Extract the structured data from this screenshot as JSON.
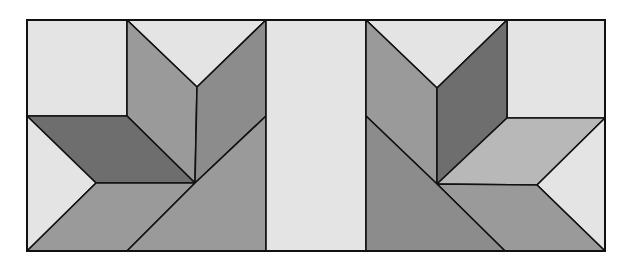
{
  "figure": {
    "colors": {
      "light": "#e4e4e4",
      "medium_light": "#b8b8b8",
      "medium": "#9a9a9a",
      "medium_dark": "#8c8c8c",
      "dark": "#6e6e6e",
      "stroke": "#111111"
    },
    "left_block": {
      "pieces": [
        {
          "name": "top-left-square",
          "shade": "light",
          "points": "27,20 127,20 127,116 27,116"
        },
        {
          "name": "top-v-triangle",
          "shade": "light",
          "points": "127,20 266,20 197,87"
        },
        {
          "name": "left-diamond-upper",
          "shade": "medium",
          "points": "127,20 197,87 195,183 127,116"
        },
        {
          "name": "right-diamond-upper",
          "shade": "medium_dark",
          "points": "197,87 266,20 266,116 195,183"
        },
        {
          "name": "dark-horizontal-diamond",
          "shade": "dark",
          "points": "27,116 127,116 195,183 96,183"
        },
        {
          "name": "left-arrow-triangle",
          "shade": "light",
          "points": "27,116 96,183 27,251"
        },
        {
          "name": "bottom-diamond",
          "shade": "medium",
          "points": "96,183 195,183 127,251 27,251"
        },
        {
          "name": "bottom-right-trapezoid",
          "shade": "medium",
          "points": "195,183 266,116 266,251 127,251"
        }
      ]
    },
    "center_strip": {
      "name": "sashing-strip",
      "shade": "light",
      "points": "266,20 366,20 366,251 266,251"
    },
    "right_block": {
      "pieces": [
        {
          "name": "top-v-triangle",
          "shade": "light",
          "points": "366,20 507,20 437,88"
        },
        {
          "name": "top-right-square",
          "shade": "light",
          "points": "507,20 605,20 605,118 507,118"
        },
        {
          "name": "left-diamond-upper",
          "shade": "medium",
          "points": "366,20 437,88 437,184 366,116"
        },
        {
          "name": "right-diamond-dark",
          "shade": "dark",
          "points": "437,88 507,20 507,118 437,184"
        },
        {
          "name": "light-horizontal-diamond",
          "shade": "medium_light",
          "points": "507,118 605,118 537,185 437,184"
        },
        {
          "name": "right-arrow-triangle",
          "shade": "light",
          "points": "605,118 605,251 537,185"
        },
        {
          "name": "bottom-diamond",
          "shade": "medium",
          "points": "437,184 537,185 605,251 505,251"
        },
        {
          "name": "bottom-left-trapezoid",
          "shade": "medium_dark",
          "points": "366,116 437,184 505,251 366,251"
        }
      ]
    },
    "outline": {
      "x": 27,
      "y": 20,
      "width": 578,
      "height": 231
    }
  }
}
